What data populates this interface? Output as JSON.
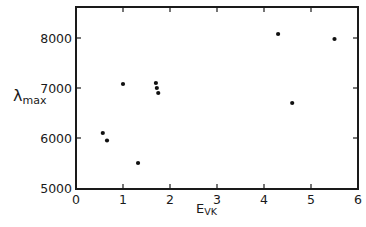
{
  "chart_data": {
    "type": "scatter",
    "title": "",
    "xlabel": "E",
    "xlabel_sub": "VK",
    "ylabel": "λ",
    "ylabel_sub": "max",
    "xlim": [
      0,
      6
    ],
    "ylim": [
      5000,
      8500
    ],
    "xticks": [
      0,
      1,
      2,
      3,
      4,
      5,
      6
    ],
    "yticks": [
      5000,
      6000,
      7000,
      8000
    ],
    "xtick_labels": [
      "0",
      "1",
      "2",
      "3",
      "4",
      "5",
      "6"
    ],
    "ytick_labels": [
      "5000",
      "6000",
      "7000",
      "8000"
    ],
    "grid": false,
    "legend": null,
    "series": [
      {
        "name": "data",
        "points": [
          {
            "x": 0.57,
            "y": 6100
          },
          {
            "x": 0.66,
            "y": 5950
          },
          {
            "x": 1.0,
            "y": 7080
          },
          {
            "x": 1.32,
            "y": 5500
          },
          {
            "x": 1.7,
            "y": 7100
          },
          {
            "x": 1.72,
            "y": 7000
          },
          {
            "x": 1.75,
            "y": 6900
          },
          {
            "x": 4.3,
            "y": 8080
          },
          {
            "x": 4.6,
            "y": 6700
          },
          {
            "x": 5.5,
            "y": 7980
          }
        ]
      }
    ]
  }
}
